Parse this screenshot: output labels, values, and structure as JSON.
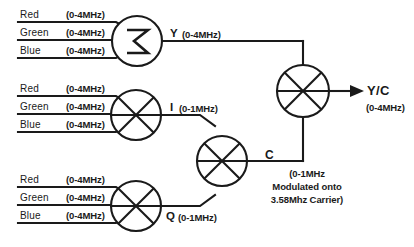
{
  "diagram": {
    "ink_color": "#1a1a1a",
    "background": "#ffffff",
    "channel_label_red": "Red",
    "channel_label_green": "Green",
    "channel_label_blue": "Blue",
    "band_rgb": "(0-4MHz)",
    "nodes": {
      "summer_glyph": "sigma-summation",
      "mixer_glyph": "six-spoke-mixer",
      "combiner_glyph": "six-spoke-mixer"
    },
    "signals": {
      "luma_tag": "Y",
      "luma_band": "(0-4MHz)",
      "i_tag": "I",
      "i_band": "(0-1MHz)",
      "q_tag": "Q",
      "q_band": "(0-1MHz)",
      "chroma_tag": "C",
      "chroma_note_1": "(0-1MHz",
      "chroma_note_2": "Modulated onto",
      "chroma_note_3": "3.58Mhz Carrier)",
      "output_tag": "Y/C",
      "output_band": "(0-4MHz)"
    },
    "groups": [
      {
        "name": "luma-input-group",
        "rows": [
          {
            "channel": "Red",
            "band": "(0-4MHz)"
          },
          {
            "channel": "Green",
            "band": "(0-4MHz)"
          },
          {
            "channel": "Blue",
            "band": "(0-4MHz)"
          }
        ]
      },
      {
        "name": "i-input-group",
        "rows": [
          {
            "channel": "Red",
            "band": "(0-4MHz)"
          },
          {
            "channel": "Green",
            "band": "(0-4MHz)"
          },
          {
            "channel": "Blue",
            "band": "(0-4MHz)"
          }
        ]
      },
      {
        "name": "q-input-group",
        "rows": [
          {
            "channel": "Red",
            "band": "(0-4MHz)"
          },
          {
            "channel": "Green",
            "band": "(0-4MHz)"
          },
          {
            "channel": "Blue",
            "band": "(0-4MHz)"
          }
        ]
      }
    ]
  }
}
